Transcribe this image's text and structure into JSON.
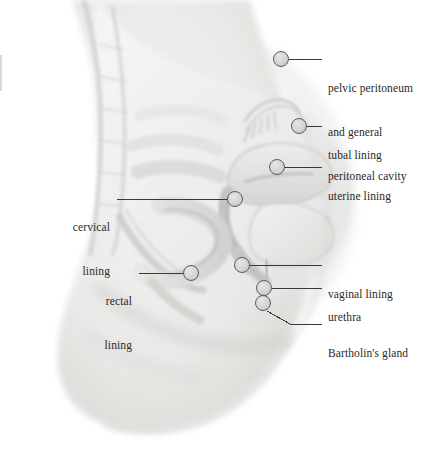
{
  "figure": {
    "width": 440,
    "height": 468,
    "background_color": "#ffffff",
    "illustration": {
      "name": "female-pelvis-sagittal-illustration",
      "style": "pale grayscale pencil/wash medical illustration",
      "body_tone": "#f0f0ef",
      "shadow_tone": "#d6d6d4",
      "outline_tone": "#c2c2c0"
    },
    "marker": {
      "diameter_px": 16,
      "fill_color": "#d8d8d8",
      "border_color": "#5c5c5c"
    },
    "leader_line_color": "#3a3a3a",
    "text_color": "#2a2a2a",
    "callouts": [
      {
        "id": "pelvic-peritoneum",
        "lines": [
          "pelvic peritoneum",
          "and general",
          "peritoneal cavity"
        ],
        "text": "pelvic peritoneum and general peritoneal cavity",
        "side": "right",
        "dot": {
          "x": 281,
          "y": 59
        },
        "text_pos": {
          "x": 328,
          "y": 52
        },
        "leader": [
          [
            289,
            59
          ],
          [
            322,
            59
          ]
        ]
      },
      {
        "id": "tubal-lining",
        "lines": [
          "tubal lining"
        ],
        "text": "tubal lining",
        "side": "right",
        "dot": {
          "x": 299,
          "y": 126
        },
        "text_pos": {
          "x": 328,
          "y": 119
        },
        "leader": [
          [
            307,
            126
          ],
          [
            322,
            126
          ]
        ]
      },
      {
        "id": "uterine-lining",
        "lines": [
          "uterine lining"
        ],
        "text": "uterine lining",
        "side": "right",
        "dot": {
          "x": 277,
          "y": 167
        },
        "text_pos": {
          "x": 328,
          "y": 160
        },
        "leader": [
          [
            285,
            167
          ],
          [
            322,
            167
          ]
        ]
      },
      {
        "id": "cervical-lining",
        "lines": [
          "cervical",
          "lining"
        ],
        "text": "cervical lining",
        "side": "left",
        "dot": {
          "x": 235,
          "y": 199
        },
        "text_pos": {
          "x": 20,
          "y": 191
        },
        "text_right_edge": 110,
        "leader": [
          [
            117,
            199
          ],
          [
            227,
            199
          ]
        ]
      },
      {
        "id": "rectal-lining",
        "lines": [
          "rectal",
          "lining"
        ],
        "text": "rectal lining",
        "side": "left",
        "dot": {
          "x": 191,
          "y": 273
        },
        "text_pos": {
          "x": 78,
          "y": 265
        },
        "text_right_edge": 132,
        "leader": [
          [
            139,
            273
          ],
          [
            183,
            273
          ]
        ]
      },
      {
        "id": "vaginal-lining",
        "lines": [
          "vaginal lining"
        ],
        "text": "vaginal lining",
        "side": "right",
        "dot": {
          "x": 242,
          "y": 265
        },
        "text_pos": {
          "x": 328,
          "y": 258
        },
        "leader": [
          [
            250,
            265
          ],
          [
            322,
            265
          ]
        ]
      },
      {
        "id": "urethra",
        "lines": [
          "urethra"
        ],
        "text": "urethra",
        "side": "right",
        "dot": {
          "x": 264,
          "y": 288
        },
        "text_pos": {
          "x": 328,
          "y": 281
        },
        "leader": [
          [
            272,
            288
          ],
          [
            322,
            288
          ]
        ]
      },
      {
        "id": "bartholins-gland",
        "lines": [
          "Bartholin's gland"
        ],
        "text": "Bartholin's gland",
        "side": "right",
        "dot": {
          "x": 263,
          "y": 303
        },
        "text_pos": {
          "x": 328,
          "y": 317
        },
        "leader": [
          [
            267,
            311
          ],
          [
            290,
            324
          ],
          [
            322,
            324
          ]
        ]
      }
    ]
  }
}
